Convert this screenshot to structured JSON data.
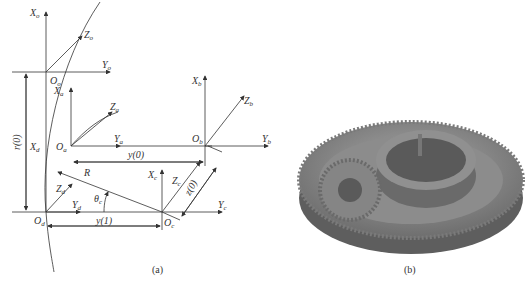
{
  "figure_a": {
    "caption": "(a)",
    "frames": [
      {
        "origin": "O",
        "origin_sub": "o",
        "x": "X",
        "x_sub": "o",
        "y": "Y",
        "y_sub": "o",
        "z": "Z",
        "z_sub": "o"
      },
      {
        "origin": "O",
        "origin_sub": "a",
        "x": "X",
        "x_sub": "a",
        "y": "Y",
        "y_sub": "a",
        "z": "Z",
        "z_sub": "a"
      },
      {
        "origin": "O",
        "origin_sub": "b",
        "x": "X",
        "x_sub": "b",
        "y": "Y",
        "y_sub": "b",
        "z": "Z",
        "z_sub": "b"
      },
      {
        "origin": "O",
        "origin_sub": "c",
        "x": "X",
        "x_sub": "c",
        "y": "Y",
        "y_sub": "c",
        "z": "Z",
        "z_sub": "c"
      },
      {
        "origin": "O",
        "origin_sub": "d",
        "x": "X",
        "x_sub": "d",
        "y": "Y",
        "y_sub": "d",
        "z": "Z",
        "z_sub": "d"
      }
    ],
    "dimensions": {
      "r0": "r(0)",
      "y0": "y(0)",
      "y1": "y(1)",
      "z0": "z(0)",
      "R": "R",
      "theta": "θ",
      "theta_sub": "c"
    }
  },
  "figure_b": {
    "caption": "(b)",
    "description": "planetary gear assembly render"
  }
}
